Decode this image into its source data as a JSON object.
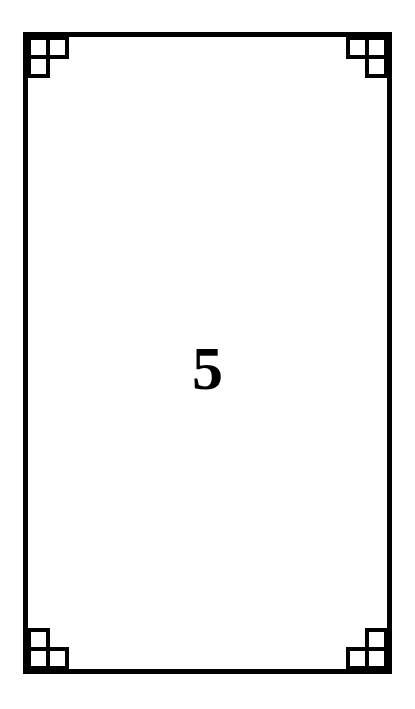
{
  "card": {
    "value": "5",
    "border_color": "#000000",
    "background_color": "#ffffff",
    "corner_ornament": "three-square-L"
  }
}
